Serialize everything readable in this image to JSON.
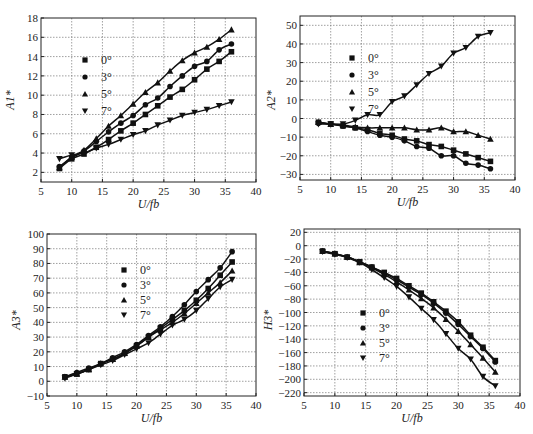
{
  "chart_data": [
    {
      "type": "line",
      "title": "",
      "xlabel": "U/fb",
      "ylabel": "A1*",
      "xlim": [
        5,
        40
      ],
      "ylim": [
        1,
        18
      ],
      "xticks": [
        5,
        10,
        15,
        20,
        25,
        30,
        35,
        40
      ],
      "yticks": [
        2,
        4,
        6,
        8,
        10,
        12,
        14,
        16,
        18
      ],
      "grid": true,
      "legend_position": "upper-left-inside",
      "x": [
        8,
        10,
        12,
        14,
        16,
        18,
        20,
        22,
        24,
        26,
        28,
        30,
        32,
        34,
        36
      ],
      "series": [
        {
          "name": "0°",
          "marker": "square",
          "values": [
            2.4,
            3.4,
            3.9,
            4.6,
            5.4,
            6.3,
            7.1,
            8.0,
            8.9,
            9.8,
            10.6,
            11.6,
            12.7,
            13.5,
            14.5
          ]
        },
        {
          "name": "3°",
          "marker": "circle",
          "values": [
            2.6,
            3.5,
            4.2,
            5.2,
            6.2,
            7.1,
            7.9,
            9.0,
            9.7,
            10.9,
            12.0,
            13.0,
            13.5,
            14.7,
            15.3
          ]
        },
        {
          "name": "5°",
          "marker": "triangle-up",
          "values": [
            2.5,
            3.6,
            4.3,
            5.5,
            6.8,
            7.9,
            9.1,
            10.3,
            11.3,
            12.5,
            13.6,
            14.4,
            15.0,
            15.8,
            16.8
          ]
        },
        {
          "name": "7°",
          "marker": "triangle-down",
          "values": [
            3.4,
            3.8,
            4.0,
            4.5,
            4.9,
            5.4,
            5.9,
            6.3,
            6.9,
            7.4,
            7.9,
            8.2,
            8.5,
            8.9,
            9.3
          ]
        }
      ]
    },
    {
      "type": "line",
      "title": "",
      "xlabel": "U/fb",
      "ylabel": "A2*",
      "xlim": [
        5,
        40
      ],
      "ylim": [
        -33,
        55
      ],
      "xticks": [
        5,
        10,
        15,
        20,
        25,
        30,
        35,
        40
      ],
      "yticks": [
        -30,
        -20,
        -10,
        0,
        10,
        20,
        30,
        40,
        50
      ],
      "grid": true,
      "legend_position": "upper-left-inside",
      "x": [
        8,
        10,
        12,
        14,
        16,
        18,
        20,
        22,
        24,
        26,
        28,
        30,
        32,
        34,
        36
      ],
      "series": [
        {
          "name": "0°",
          "marker": "square",
          "values": [
            -2,
            -3,
            -4,
            -5,
            -6,
            -8,
            -9,
            -11,
            -12,
            -14,
            -15,
            -17,
            -19,
            -21,
            -23
          ]
        },
        {
          "name": "3°",
          "marker": "circle",
          "values": [
            -2.5,
            -3,
            -4,
            -5,
            -7,
            -9,
            -10,
            -12,
            -15,
            -16,
            -20,
            -20,
            -24,
            -25,
            -27
          ]
        },
        {
          "name": "5°",
          "marker": "triangle-up",
          "values": [
            -2,
            -3,
            -3.5,
            -4.5,
            -5,
            -5,
            -5,
            -5,
            -6,
            -6,
            -5,
            -7,
            -7,
            -9,
            -11
          ]
        },
        {
          "name": "7°",
          "marker": "triangle-down",
          "values": [
            -3,
            -3,
            -3,
            -1,
            2,
            2,
            9,
            12,
            18,
            24,
            28,
            35,
            38,
            44,
            46
          ]
        }
      ]
    },
    {
      "type": "line",
      "title": "",
      "xlabel": "U/fb",
      "ylabel": "A3*",
      "xlim": [
        5,
        40
      ],
      "ylim": [
        -10,
        100
      ],
      "xticks": [
        5,
        10,
        15,
        20,
        25,
        30,
        35,
        40
      ],
      "yticks": [
        -10,
        0,
        10,
        20,
        30,
        40,
        50,
        60,
        70,
        80,
        90,
        100
      ],
      "grid": true,
      "legend_position": "upper-left-inside",
      "x": [
        8,
        10,
        12,
        14,
        16,
        18,
        20,
        22,
        24,
        26,
        28,
        30,
        32,
        34,
        36
      ],
      "series": [
        {
          "name": "0°",
          "marker": "square",
          "values": [
            3,
            5,
            8,
            12,
            15,
            19,
            24,
            30,
            36,
            42,
            48,
            55,
            63,
            72,
            81
          ]
        },
        {
          "name": "3°",
          "marker": "circle",
          "values": [
            3,
            6,
            9,
            12,
            16,
            20,
            25,
            31,
            37,
            44,
            52,
            61,
            69,
            77,
            88
          ]
        },
        {
          "name": "5°",
          "marker": "triangle-up",
          "values": [
            3,
            5,
            8,
            12,
            15,
            19,
            24,
            30,
            35,
            40,
            46,
            53,
            60,
            67,
            75
          ]
        },
        {
          "name": "7°",
          "marker": "triangle-down",
          "values": [
            2,
            5,
            8,
            11,
            14,
            18,
            22,
            26,
            32,
            38,
            42,
            48,
            56,
            64,
            69
          ]
        }
      ]
    },
    {
      "type": "line",
      "title": "",
      "xlabel": "U/fb",
      "ylabel": "H3*",
      "xlim": [
        5,
        40
      ],
      "ylim": [
        -225,
        25
      ],
      "xticks": [
        5,
        10,
        15,
        20,
        25,
        30,
        35,
        40
      ],
      "yticks": [
        -220,
        -200,
        -180,
        -160,
        -140,
        -120,
        -100,
        -80,
        -60,
        -40,
        -20,
        0,
        20
      ],
      "grid": true,
      "legend_position": "lower-left-inside",
      "x": [
        8,
        10,
        12,
        14,
        16,
        18,
        20,
        22,
        24,
        26,
        28,
        30,
        32,
        34,
        36
      ],
      "series": [
        {
          "name": "0°",
          "marker": "square",
          "values": [
            -8,
            -12,
            -17,
            -24,
            -32,
            -40,
            -49,
            -60,
            -71,
            -84,
            -98,
            -114,
            -134,
            -152,
            -172
          ]
        },
        {
          "name": "3°",
          "marker": "circle",
          "values": [
            -8,
            -12,
            -17,
            -24,
            -32,
            -41,
            -51,
            -62,
            -73,
            -86,
            -101,
            -118,
            -136,
            -154,
            -174
          ]
        },
        {
          "name": "5°",
          "marker": "triangle-up",
          "values": [
            -8,
            -12,
            -17,
            -25,
            -33,
            -43,
            -54,
            -66,
            -79,
            -93,
            -110,
            -128,
            -148,
            -168,
            -189
          ]
        },
        {
          "name": "7°",
          "marker": "triangle-down",
          "values": [
            -9,
            -13,
            -18,
            -25,
            -36,
            -48,
            -61,
            -77,
            -94,
            -111,
            -132,
            -154,
            -170,
            -196,
            -210
          ]
        }
      ]
    }
  ]
}
